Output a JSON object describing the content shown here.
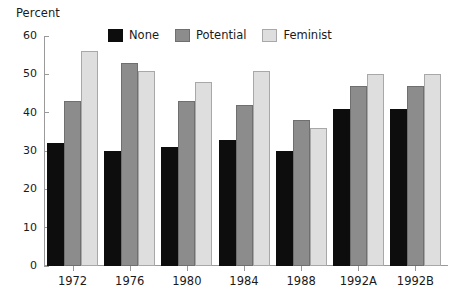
{
  "chart_data": {
    "type": "bar",
    "title": "",
    "subtitle": "",
    "xlabel": "",
    "ylabel": "Percent",
    "ylim": [
      0,
      60
    ],
    "yticks": [
      0,
      10,
      20,
      30,
      40,
      50,
      60
    ],
    "ytick_labels": [
      "0",
      "10",
      "20",
      "30",
      "40",
      "50",
      "60"
    ],
    "grid": false,
    "legend_position": "top-center-inside",
    "categories": [
      "1972",
      "1976",
      "1980",
      "1984",
      "1988",
      "1992A",
      "1992B"
    ],
    "series": [
      {
        "name": "None",
        "color": "#0d0d0d",
        "values": [
          32,
          30,
          31,
          33,
          30,
          41,
          41
        ]
      },
      {
        "name": "Potential",
        "color": "#8c8c8c",
        "values": [
          43,
          53,
          43,
          42,
          38,
          47,
          47
        ]
      },
      {
        "name": "Feminist",
        "color": "#dedede",
        "values": [
          56,
          51,
          48,
          51,
          36,
          50,
          50
        ]
      }
    ]
  },
  "axis": {
    "y_title": "Percent"
  },
  "legend": {
    "items": [
      {
        "label": "None",
        "swatch": "legend-swatch-none"
      },
      {
        "label": "Potential",
        "swatch": "legend-swatch-potential"
      },
      {
        "label": "Feminist",
        "swatch": "legend-swatch-feminist"
      }
    ]
  },
  "colors": {
    "none": "#0d0d0d",
    "potential": "#8c8c8c",
    "feminist": "#dedede",
    "axis": "#9a9a9a",
    "text": "#1a1a1a",
    "background": "#ffffff"
  }
}
